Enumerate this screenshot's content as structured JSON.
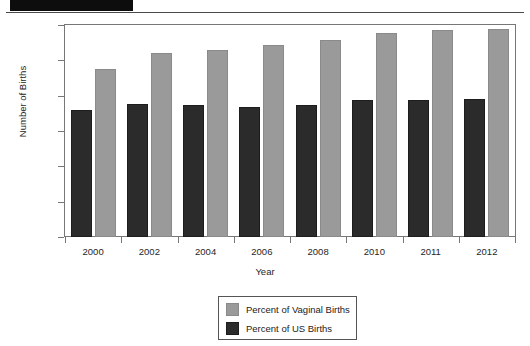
{
  "document": {
    "redaction_label": "",
    "header_rule": true
  },
  "chart_data": {
    "type": "bar",
    "title": "",
    "xlabel": "Year",
    "ylabel": "Number of Births",
    "categories": [
      "2000",
      "2002",
      "2004",
      "2006",
      "2008",
      "2010",
      "2011",
      "2012"
    ],
    "series": [
      {
        "name": "Percent of US Births",
        "key": "us",
        "color": "#2b2b2b",
        "values": [
          7.2,
          7.55,
          7.5,
          7.35,
          7.45,
          7.75,
          7.75,
          7.8
        ]
      },
      {
        "name": "Percent of Vaginal Births",
        "key": "vaginal",
        "color": "#9a9a9a",
        "values": [
          9.5,
          10.4,
          10.6,
          10.85,
          11.15,
          11.55,
          11.7,
          11.8
        ]
      }
    ],
    "ylim": [
      0,
      12
    ],
    "yticks": [
      0,
      2,
      4,
      6,
      8,
      10,
      12
    ],
    "ytick_labels": [
      "0",
      "2%",
      "4%",
      "6%",
      "8%",
      "10%",
      "12%"
    ],
    "grid": false,
    "legend_position": "bottom-center",
    "legend_entries": [
      {
        "label": "Percent of Vaginal Births",
        "key": "vaginal"
      },
      {
        "label": "Percent of US Births",
        "key": "us"
      }
    ]
  }
}
